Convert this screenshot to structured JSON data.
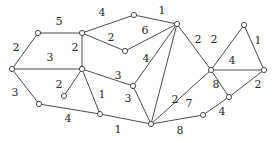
{
  "graph": {
    "nodes": [
      "A",
      "B",
      "C",
      "D",
      "E",
      "F",
      "G",
      "H",
      "I",
      "J",
      "K",
      "L",
      "M",
      "N",
      "O",
      "P",
      "Q"
    ],
    "edges": [
      {
        "from": "A",
        "to": "B"
      },
      {
        "from": "A",
        "to": "C"
      },
      {
        "from": "C",
        "to": "D"
      },
      {
        "from": "B",
        "to": "D"
      },
      {
        "from": "C",
        "to": "E"
      },
      {
        "from": "C",
        "to": "F"
      },
      {
        "from": "E",
        "to": "G"
      },
      {
        "from": "F",
        "to": "G"
      },
      {
        "from": "G",
        "to": "K"
      },
      {
        "from": "G",
        "to": "L"
      },
      {
        "from": "G",
        "to": "M"
      },
      {
        "from": "D",
        "to": "K"
      },
      {
        "from": "D",
        "to": "H"
      },
      {
        "from": "D",
        "to": "J"
      },
      {
        "from": "B",
        "to": "I"
      },
      {
        "from": "I",
        "to": "J"
      },
      {
        "from": "J",
        "to": "L"
      },
      {
        "from": "K",
        "to": "L"
      },
      {
        "from": "L",
        "to": "M"
      },
      {
        "from": "L",
        "to": "Q"
      },
      {
        "from": "Q",
        "to": "P"
      },
      {
        "from": "P",
        "to": "O"
      },
      {
        "from": "M",
        "to": "P"
      },
      {
        "from": "M",
        "to": "N"
      },
      {
        "from": "N",
        "to": "O"
      },
      {
        "from": "M",
        "to": "O"
      }
    ],
    "labels": [
      {
        "id": "l-ac",
        "text": "5"
      },
      {
        "id": "l-ab",
        "text": "2"
      },
      {
        "id": "l-abd",
        "text": "3"
      },
      {
        "id": "l-cd",
        "text": "2"
      },
      {
        "id": "l-ce",
        "text": "4"
      },
      {
        "id": "l-cf",
        "text": "2"
      },
      {
        "id": "l-fg",
        "text": "6"
      },
      {
        "id": "l-eg",
        "text": "1"
      },
      {
        "id": "l-gm",
        "text": "2"
      },
      {
        "id": "l-mn",
        "text": "2"
      },
      {
        "id": "l-no",
        "text": "1"
      },
      {
        "id": "l-mno",
        "text": "4"
      },
      {
        "id": "l-dk",
        "text": "3"
      },
      {
        "id": "l-gk",
        "text": "4"
      },
      {
        "id": "l-gl",
        "text": "2"
      },
      {
        "id": "l-dh",
        "text": "2"
      },
      {
        "id": "l-dj",
        "text": "1"
      },
      {
        "id": "l-dkl",
        "text": "3"
      },
      {
        "id": "l-bi",
        "text": "3"
      },
      {
        "id": "l-ij",
        "text": "4"
      },
      {
        "id": "l-jl",
        "text": "1"
      },
      {
        "id": "l-lm",
        "text": "7"
      },
      {
        "id": "l-lq",
        "text": "8"
      },
      {
        "id": "l-mp",
        "text": "8"
      },
      {
        "id": "l-po",
        "text": "2"
      },
      {
        "id": "l-qp",
        "text": "4"
      }
    ]
  }
}
